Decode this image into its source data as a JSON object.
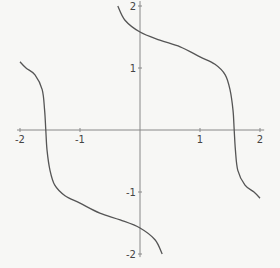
{
  "chart_data": {
    "type": "line",
    "title": "",
    "xlabel": "",
    "ylabel": "",
    "xlim": [
      -2,
      2
    ],
    "ylim": [
      -2,
      2
    ],
    "grid": false,
    "legend": null,
    "x_ticks": [
      -2,
      -1,
      1,
      2
    ],
    "y_ticks": [
      -2,
      -1,
      1,
      2
    ],
    "x_tick_labels": [
      "-2",
      "-1",
      "1",
      "2"
    ],
    "y_tick_labels": [
      "-2",
      "-1",
      "1",
      "2"
    ],
    "colors": {
      "curve": "#555555",
      "axes": "#888888",
      "background": "#f7f7f5"
    },
    "series": [
      {
        "name": "upper-branch",
        "points": [
          [
            -0.37,
            2.0
          ],
          [
            -0.25,
            1.77
          ],
          [
            0.0,
            1.58
          ],
          [
            0.33,
            1.45
          ],
          [
            0.67,
            1.34
          ],
          [
            1.0,
            1.18
          ],
          [
            1.25,
            1.06
          ],
          [
            1.42,
            0.89
          ],
          [
            1.5,
            0.65
          ],
          [
            1.55,
            0.32
          ],
          [
            1.57,
            0.0
          ],
          [
            1.59,
            -0.32
          ],
          [
            1.63,
            -0.65
          ],
          [
            1.75,
            -0.89
          ],
          [
            1.9,
            -1.0
          ],
          [
            2.0,
            -1.1
          ]
        ]
      },
      {
        "name": "lower-branch",
        "points": [
          [
            -2.0,
            1.1
          ],
          [
            -1.9,
            1.0
          ],
          [
            -1.75,
            0.89
          ],
          [
            -1.63,
            0.65
          ],
          [
            -1.59,
            0.32
          ],
          [
            -1.57,
            0.0
          ],
          [
            -1.55,
            -0.32
          ],
          [
            -1.5,
            -0.65
          ],
          [
            -1.42,
            -0.89
          ],
          [
            -1.25,
            -1.06
          ],
          [
            -1.0,
            -1.18
          ],
          [
            -0.67,
            -1.34
          ],
          [
            -0.33,
            -1.45
          ],
          [
            0.0,
            -1.58
          ],
          [
            0.25,
            -1.77
          ],
          [
            0.37,
            -2.0
          ]
        ]
      }
    ]
  },
  "layout": {
    "origin_px": [
      140,
      130
    ],
    "scale_x": 60,
    "scale_y": 62
  }
}
